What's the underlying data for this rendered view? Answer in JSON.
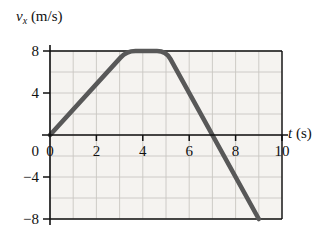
{
  "figure": {
    "background_color": "#ffffff",
    "plot_background_color": "#f5f3f0",
    "grid_color": "#c9c6c2",
    "axis_color": "#111111",
    "curve_color": "#585858"
  },
  "labels": {
    "y_symbol": "v",
    "y_subscript": "x",
    "y_units": "(m/s)",
    "x_symbol": "t",
    "x_units": "(s)"
  },
  "chart_data": {
    "type": "line",
    "title": "",
    "xlabel": "t (s)",
    "ylabel": "v_x (m/s)",
    "xlim": [
      0,
      10
    ],
    "ylim": [
      -8,
      8
    ],
    "xticks": [
      0,
      2,
      4,
      6,
      8,
      10
    ],
    "xtick_labels": [
      "0",
      "2",
      "4",
      "6",
      "8",
      "10"
    ],
    "yticks": [
      -8,
      -4,
      0,
      4,
      8
    ],
    "ytick_labels": [
      "-8",
      "-4",
      "0",
      "4",
      "8"
    ],
    "grid": true,
    "grid_x_step": 1,
    "grid_y_step": 2,
    "legend": "none",
    "series": [
      {
        "name": "v_x",
        "x": [
          0.0,
          3.3,
          5.0,
          9.0
        ],
        "y": [
          0.0,
          8.0,
          8.0,
          -8.0
        ],
        "corner_rounding": true,
        "zero_crossing_t": 7.0,
        "segments": [
          {
            "description": "linear rise",
            "t_start": 0.0,
            "t_end": 3.3,
            "v_start": 0.0,
            "v_end": 8.0,
            "slope": 2.4
          },
          {
            "description": "constant plateau",
            "t_start": 3.3,
            "t_end": 5.0,
            "v_start": 8.0,
            "v_end": 8.0,
            "slope": 0.0
          },
          {
            "description": "linear fall",
            "t_start": 5.0,
            "t_end": 9.0,
            "v_start": 8.0,
            "v_end": -8.0,
            "slope": -4.0
          }
        ]
      }
    ]
  }
}
